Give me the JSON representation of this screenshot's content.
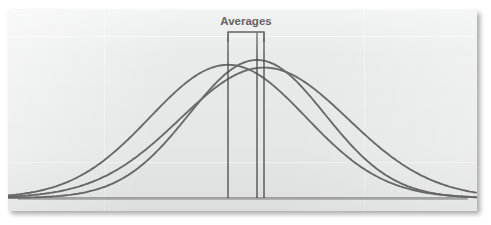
{
  "figure": {
    "title": "Averages",
    "background_color": "#e9eaea",
    "page_background": "#ffffff",
    "curve_color": "#6b6b6b",
    "line_color": "#4a4a4a",
    "baseline_color": "#888888",
    "title_color": "#221f1e"
  },
  "chart_data": {
    "type": "line",
    "title": "Averages",
    "subtitle": "",
    "xlabel": "",
    "ylabel": "",
    "xlim": [
      0,
      469
    ],
    "ylim": [
      0,
      1
    ],
    "grid": false,
    "legend": false,
    "legend_position": "none",
    "annotations": [
      {
        "name": "averages-bracket",
        "label": "Averages",
        "type": "bracket",
        "x_start": 220,
        "x_end": 256,
        "y": 22
      }
    ],
    "series": [
      {
        "name": "curve-1",
        "mean": 220,
        "sigma": 78,
        "peak_y": 0.965,
        "color": "#6b6b6b",
        "mean_marker_x": 220
      },
      {
        "name": "curve-2",
        "mean": 249,
        "sigma": 68,
        "peak_y": 1.0,
        "color": "#6b6b6b",
        "mean_marker_x": 249
      },
      {
        "name": "curve-3",
        "mean": 256,
        "sigma": 84,
        "peak_y": 0.945,
        "color": "#6b6b6b",
        "mean_marker_x": 256
      }
    ],
    "mean_lines": [
      {
        "name": "mean-line-1",
        "x": 220
      },
      {
        "name": "mean-line-2",
        "x": 249
      },
      {
        "name": "mean-line-3",
        "x": 256
      }
    ],
    "baseline": {
      "y": 188,
      "x_start": 10,
      "x_end": 460
    }
  }
}
